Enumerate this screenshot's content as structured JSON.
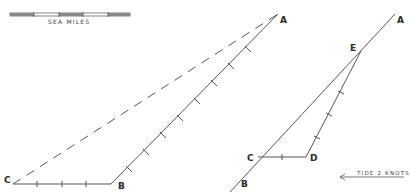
{
  "scale_bar": {
    "label": "SEA MILES",
    "segments": 4
  },
  "left_figure": {
    "points": {
      "A": {
        "label": "A",
        "x": 278,
        "y": 14
      },
      "B": {
        "label": "B",
        "x": 111,
        "y": 184
      },
      "C": {
        "label": "C",
        "x": 13,
        "y": 184
      }
    },
    "lines": [
      {
        "from": "C",
        "to": "B",
        "style": "solid",
        "ticks": 3
      },
      {
        "from": "B",
        "to": "A",
        "style": "solid",
        "ticks": 8
      },
      {
        "from": "C",
        "to": "A",
        "style": "dashed",
        "ticks": 0
      }
    ]
  },
  "right_figure": {
    "points": {
      "A": {
        "label": "A",
        "x": 395,
        "y": 14
      },
      "B": {
        "label": "B",
        "x": 230,
        "y": 192
      },
      "E": {
        "label": "E",
        "x": 361,
        "y": 51
      },
      "C": {
        "label": "C",
        "x": 258,
        "y": 157
      },
      "D": {
        "label": "D",
        "x": 306,
        "y": 157
      }
    },
    "lines": [
      {
        "from": "B",
        "to": "A",
        "style": "solid",
        "ticks": 0
      },
      {
        "from": "C",
        "to": "D",
        "style": "solid",
        "ticks": 1
      },
      {
        "from": "D",
        "to": "E",
        "style": "solid",
        "ticks": 3
      }
    ]
  },
  "tide": {
    "label": "TIDE 2 KNOTS",
    "direction": "left"
  },
  "colors": {
    "line": "#555555",
    "text": "#2a2a2a",
    "background": "#ffffff"
  }
}
